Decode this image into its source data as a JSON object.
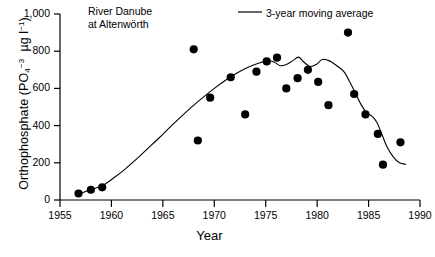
{
  "chart_data": {
    "type": "scatter",
    "title": "",
    "annotation": "River Danube\nat Altenwörth",
    "xlabel": "Year",
    "ylabel_text": "Orthophosphate (PO4-3  µg l-1)",
    "xlim": [
      1955,
      1990
    ],
    "ylim": [
      0,
      1000
    ],
    "xticks": [
      1955,
      1960,
      1965,
      1970,
      1975,
      1980,
      1985,
      1990
    ],
    "xtick_labels": [
      "1955",
      "1960",
      "1965",
      "1970",
      "1975",
      "1980",
      "1985",
      "1990"
    ],
    "yticks": [
      0,
      200,
      400,
      600,
      800,
      1000
    ],
    "ytick_labels": [
      "0",
      "200",
      "400",
      "600",
      "800",
      "1,000"
    ],
    "grid": false,
    "legend_position": "top-right",
    "legend": [
      {
        "name": "3-year moving average",
        "marker": "line",
        "color": "#000000"
      }
    ],
    "series": [
      {
        "name": "Orthophosphate observations",
        "type": "scatter",
        "marker": "filled-circle",
        "color": "#000000",
        "points": [
          {
            "x": 1956.8,
            "y": 35
          },
          {
            "x": 1958.0,
            "y": 55
          },
          {
            "x": 1959.1,
            "y": 68
          },
          {
            "x": 1968.0,
            "y": 810
          },
          {
            "x": 1968.4,
            "y": 320
          },
          {
            "x": 1969.6,
            "y": 550
          },
          {
            "x": 1971.6,
            "y": 660
          },
          {
            "x": 1973.0,
            "y": 460
          },
          {
            "x": 1974.1,
            "y": 690
          },
          {
            "x": 1975.1,
            "y": 745
          },
          {
            "x": 1976.1,
            "y": 765
          },
          {
            "x": 1977.0,
            "y": 600
          },
          {
            "x": 1978.1,
            "y": 655
          },
          {
            "x": 1979.1,
            "y": 700
          },
          {
            "x": 1980.1,
            "y": 635
          },
          {
            "x": 1981.1,
            "y": 510
          },
          {
            "x": 1983.0,
            "y": 900
          },
          {
            "x": 1983.6,
            "y": 570
          },
          {
            "x": 1984.7,
            "y": 460
          },
          {
            "x": 1985.9,
            "y": 355
          },
          {
            "x": 1986.4,
            "y": 190
          },
          {
            "x": 1988.1,
            "y": 310
          }
        ]
      },
      {
        "name": "3-year moving average",
        "type": "line",
        "color": "#000000",
        "points": [
          {
            "x": 1956.9,
            "y": 30
          },
          {
            "x": 1957.6,
            "y": 48
          },
          {
            "x": 1958.4,
            "y": 62
          },
          {
            "x": 1959.2,
            "y": 80
          },
          {
            "x": 1960.2,
            "y": 118
          },
          {
            "x": 1961.3,
            "y": 165
          },
          {
            "x": 1962.4,
            "y": 218
          },
          {
            "x": 1963.5,
            "y": 275
          },
          {
            "x": 1964.6,
            "y": 332
          },
          {
            "x": 1965.7,
            "y": 392
          },
          {
            "x": 1966.8,
            "y": 450
          },
          {
            "x": 1967.9,
            "y": 505
          },
          {
            "x": 1969.0,
            "y": 556
          },
          {
            "x": 1970.1,
            "y": 604
          },
          {
            "x": 1971.2,
            "y": 648
          },
          {
            "x": 1972.3,
            "y": 686
          },
          {
            "x": 1973.4,
            "y": 716
          },
          {
            "x": 1974.3,
            "y": 735
          },
          {
            "x": 1975.1,
            "y": 748
          },
          {
            "x": 1975.8,
            "y": 742
          },
          {
            "x": 1976.4,
            "y": 722
          },
          {
            "x": 1977.0,
            "y": 728
          },
          {
            "x": 1977.6,
            "y": 748
          },
          {
            "x": 1978.2,
            "y": 768
          },
          {
            "x": 1978.7,
            "y": 742
          },
          {
            "x": 1979.3,
            "y": 718
          },
          {
            "x": 1979.9,
            "y": 728
          },
          {
            "x": 1980.5,
            "y": 755
          },
          {
            "x": 1981.2,
            "y": 748
          },
          {
            "x": 1981.9,
            "y": 722
          },
          {
            "x": 1982.6,
            "y": 690
          },
          {
            "x": 1983.2,
            "y": 632
          },
          {
            "x": 1983.8,
            "y": 566
          },
          {
            "x": 1984.3,
            "y": 510
          },
          {
            "x": 1984.8,
            "y": 470
          },
          {
            "x": 1985.3,
            "y": 452
          },
          {
            "x": 1985.8,
            "y": 418
          },
          {
            "x": 1986.3,
            "y": 352
          },
          {
            "x": 1986.8,
            "y": 285
          },
          {
            "x": 1987.4,
            "y": 232
          },
          {
            "x": 1988.0,
            "y": 200
          },
          {
            "x": 1988.6,
            "y": 192
          }
        ]
      }
    ]
  }
}
